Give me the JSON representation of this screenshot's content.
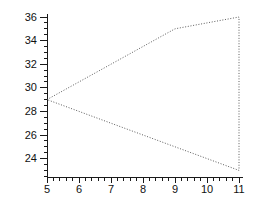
{
  "chart_data": {
    "type": "line",
    "title": "",
    "xlabel": "",
    "ylabel": "",
    "grid": false,
    "legend": "none",
    "background_color": "#ffffff",
    "axis_color": "#1a1a1a",
    "line_color": "#4a4a4a",
    "line_style": "dotted",
    "closed_shape": true,
    "xlim": [
      5,
      11.1
    ],
    "ylim": [
      22.4,
      36.3
    ],
    "x_major_ticks": [
      5,
      6,
      7,
      8,
      9,
      10,
      11
    ],
    "x_tick_labels": [
      "5",
      "6",
      "7",
      "8",
      "9",
      "10",
      "11"
    ],
    "x_minor_step": 0.2,
    "y_major_ticks": [
      24,
      26,
      28,
      30,
      32,
      34,
      36
    ],
    "y_tick_labels": [
      "24",
      "26",
      "28",
      "30",
      "32",
      "34",
      "36"
    ],
    "y_minor_step": 0.5,
    "y_minor_start": 22.5,
    "series": [
      {
        "name": "polygon-outline",
        "points": [
          [
            5,
            29
          ],
          [
            9,
            35
          ],
          [
            11,
            36
          ],
          [
            11,
            23
          ]
        ]
      }
    ]
  }
}
